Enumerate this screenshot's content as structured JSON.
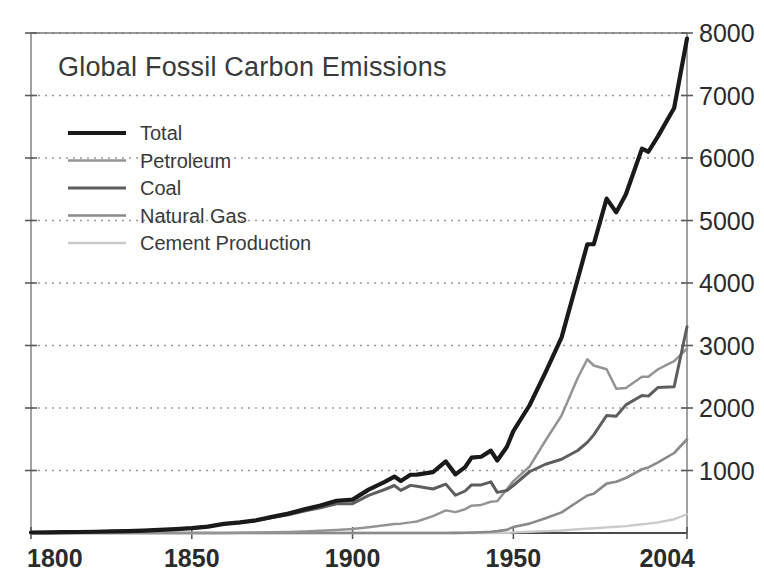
{
  "chart_data": {
    "type": "line",
    "title": "Global Fossil Carbon Emissions",
    "xlabel": "",
    "ylabel": "",
    "xlim": [
      1800,
      2004
    ],
    "ylim": [
      0,
      8000
    ],
    "grid": true,
    "legend_position": "upper-left",
    "x_ticks": [
      "1800",
      "1850",
      "1900",
      "1950",
      "2004"
    ],
    "x_tick_values": [
      1800,
      1850,
      1900,
      1950,
      2004
    ],
    "y_ticks": [
      "1000",
      "2000",
      "3000",
      "4000",
      "5000",
      "6000",
      "7000",
      "8000"
    ],
    "y_tick_values": [
      1000,
      2000,
      3000,
      4000,
      5000,
      6000,
      7000,
      8000
    ],
    "y_axis_side": "right",
    "units": "million metric tons of carbon per year",
    "x": [
      1800,
      1805,
      1810,
      1815,
      1820,
      1825,
      1830,
      1835,
      1840,
      1845,
      1850,
      1855,
      1860,
      1865,
      1870,
      1875,
      1880,
      1885,
      1890,
      1895,
      1900,
      1905,
      1910,
      1913,
      1915,
      1918,
      1920,
      1925,
      1929,
      1932,
      1935,
      1937,
      1940,
      1943,
      1945,
      1948,
      1950,
      1955,
      1960,
      1965,
      1970,
      1973,
      1975,
      1979,
      1982,
      1985,
      1990,
      1992,
      1995,
      2000,
      2004
    ],
    "series": [
      {
        "name": "Total",
        "color": "#1a1a1a",
        "width": 4.2,
        "values": [
          8,
          10,
          13,
          16,
          20,
          25,
          30,
          38,
          49,
          62,
          79,
          103,
          147,
          170,
          204,
          258,
          310,
          378,
          440,
          516,
          534,
          694,
          819,
          903,
          832,
          932,
          933,
          975,
          1145,
          938,
          1053,
          1207,
          1220,
          1318,
          1160,
          1380,
          1630,
          2040,
          2570,
          3130,
          4060,
          4620,
          4620,
          5350,
          5130,
          5420,
          6150,
          6100,
          6350,
          6800,
          7910
        ]
      },
      {
        "name": "Petroleum",
        "color": "#949494",
        "width": 2.5,
        "values": [
          0,
          0,
          0,
          0,
          0,
          0,
          0,
          0,
          0,
          0,
          0,
          0,
          1,
          4,
          7,
          12,
          18,
          25,
          36,
          48,
          64,
          92,
          123,
          143,
          150,
          170,
          184,
          271,
          362,
          334,
          381,
          438,
          450,
          500,
          510,
          700,
          830,
          1060,
          1480,
          1880,
          2480,
          2780,
          2680,
          2620,
          2310,
          2320,
          2500,
          2500,
          2620,
          2750,
          2950
        ]
      },
      {
        "name": "Coal",
        "color": "#5e5e5e",
        "width": 3.0,
        "values": [
          8,
          10,
          13,
          16,
          20,
          25,
          30,
          38,
          49,
          62,
          79,
          103,
          146,
          166,
          197,
          246,
          292,
          353,
          404,
          468,
          470,
          602,
          696,
          760,
          682,
          762,
          749,
          704,
          782,
          604,
          672,
          769,
          770,
          818,
          650,
          680,
          760,
          980,
          1100,
          1180,
          1320,
          1450,
          1570,
          1880,
          1870,
          2050,
          2200,
          2190,
          2330,
          2340,
          3300
        ]
      },
      {
        "name": "Natural Gas",
        "color": "#8a8a8a",
        "width": 2.6,
        "values": [
          0,
          0,
          0,
          0,
          0,
          0,
          0,
          0,
          0,
          0,
          0,
          0,
          0,
          0,
          0,
          0,
          0,
          0,
          0,
          0,
          0,
          0,
          0,
          0,
          0,
          0,
          0,
          0,
          1,
          2,
          4,
          7,
          12,
          20,
          30,
          50,
          97,
          150,
          235,
          330,
          500,
          600,
          630,
          790,
          820,
          880,
          1020,
          1050,
          1130,
          1280,
          1500
        ]
      },
      {
        "name": "Cement Production",
        "color": "#c9c9c9",
        "width": 2.4,
        "values": [
          0,
          0,
          0,
          0,
          0,
          0,
          0,
          0,
          0,
          0,
          0,
          0,
          0,
          0,
          0,
          0,
          0,
          0,
          0,
          0,
          0,
          0,
          0,
          0,
          0,
          0,
          0,
          0,
          0,
          0,
          0,
          0,
          0,
          0,
          0,
          0,
          10,
          20,
          30,
          40,
          60,
          70,
          75,
          90,
          100,
          110,
          140,
          150,
          170,
          220,
          300
        ]
      }
    ]
  },
  "legend": {
    "items": [
      {
        "label": "Total"
      },
      {
        "label": "Petroleum"
      },
      {
        "label": "Coal"
      },
      {
        "label": "Natural Gas"
      },
      {
        "label": "Cement Production"
      }
    ]
  },
  "colors": {
    "total": "#1a1a1a",
    "petroleum": "#949494",
    "coal": "#5e5e5e",
    "natural_gas": "#8a8a8a",
    "cement": "#c9c9c9",
    "gridline": "#9a9a9a",
    "axis": "#7a7a7a",
    "text": "#3a3a3a",
    "background": "#ffffff"
  }
}
